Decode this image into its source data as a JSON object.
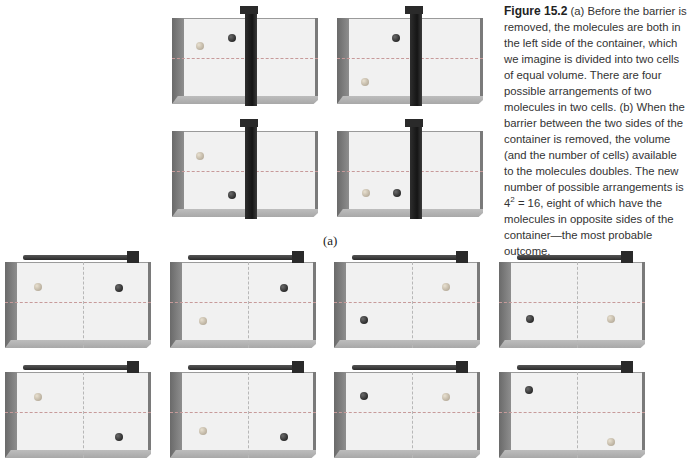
{
  "figure": {
    "number_label": "Figure 15.2",
    "caption_part1": " (a) Before the barrier is removed, the molecules are both in the left side of the container, which we imagine is divided into two cells of equal volume. There are four possible arrangements of two molecules in two cells. (b) When the barrier between the two sides of the container is removed, the volume (and the number of cells) available to the molecules doubles. The new number of possible arrangements is 4",
    "caption_exponent": "2",
    "caption_part2": " = 16, eight of which have the molecules in opposite sides of the container—the most probable outcome.",
    "part_a_label": "(a)"
  },
  "colors": {
    "light_molecule": "#b8ad9a",
    "dark_molecule": "#1a1a1a",
    "barrier": "#1f1f1f",
    "dashed_divider": "#c79a9a"
  },
  "part_a": {
    "containers": [
      {
        "molecules": [
          {
            "type": "light",
            "x": 24,
            "y": 32
          },
          {
            "type": "dark",
            "x": 56,
            "y": 24
          }
        ]
      },
      {
        "molecules": [
          {
            "type": "dark",
            "x": 55,
            "y": 24
          },
          {
            "type": "light",
            "x": 24,
            "y": 68
          }
        ]
      },
      {
        "molecules": [
          {
            "type": "light",
            "x": 24,
            "y": 29
          },
          {
            "type": "dark",
            "x": 56,
            "y": 68
          }
        ]
      },
      {
        "molecules": [
          {
            "type": "light",
            "x": 25,
            "y": 66
          },
          {
            "type": "dark",
            "x": 56,
            "y": 66
          }
        ]
      }
    ]
  },
  "part_b": {
    "containers": [
      {
        "molecules": [
          {
            "type": "light",
            "x": 29,
            "y": 29
          },
          {
            "type": "dark",
            "x": 110,
            "y": 30
          }
        ]
      },
      {
        "molecules": [
          {
            "type": "dark",
            "x": 110,
            "y": 30
          },
          {
            "type": "light",
            "x": 29,
            "y": 63
          }
        ]
      },
      {
        "molecules": [
          {
            "type": "light",
            "x": 108,
            "y": 29
          },
          {
            "type": "dark",
            "x": 26,
            "y": 62
          }
        ]
      },
      {
        "molecules": [
          {
            "type": "dark",
            "x": 27,
            "y": 61
          },
          {
            "type": "light",
            "x": 108,
            "y": 61
          }
        ]
      },
      {
        "molecules": [
          {
            "type": "light",
            "x": 29,
            "y": 29
          },
          {
            "type": "dark",
            "x": 110,
            "y": 69
          }
        ]
      },
      {
        "molecules": [
          {
            "type": "light",
            "x": 29,
            "y": 63
          },
          {
            "type": "dark",
            "x": 110,
            "y": 69
          }
        ]
      },
      {
        "molecules": [
          {
            "type": "dark",
            "x": 26,
            "y": 28
          },
          {
            "type": "light",
            "x": 108,
            "y": 29
          }
        ]
      },
      {
        "molecules": [
          {
            "type": "dark",
            "x": 26,
            "y": 22
          },
          {
            "type": "light",
            "x": 108,
            "y": 74
          }
        ]
      }
    ]
  }
}
